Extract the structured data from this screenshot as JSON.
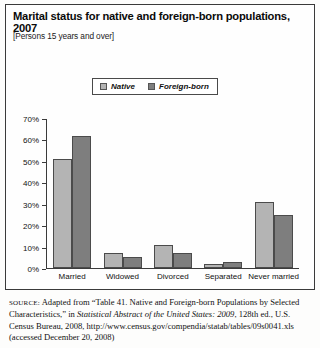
{
  "figure": {
    "title": "Marital status for native and foreign-born populations, 2007",
    "subtitle": "[Persons 15 years and over]"
  },
  "legend": {
    "items": [
      {
        "label": "Native",
        "color": "#b4b4b4",
        "icon": "legend-swatch-icon"
      },
      {
        "label": "Foreign-born",
        "color": "#7e7e7e",
        "icon": "legend-swatch-icon"
      }
    ]
  },
  "source": {
    "label": "SOURCE:",
    "text": " Adapted from “Table 41. Native and Foreign-born Populations by Selected Characteristics,” in ",
    "italic_title": "Statistical Abstract of the United States: 2009",
    "text_after": ", 128th ed., U.S. Census Bureau, 2008, http://www.census.gov/compendia/statab/tables/09s0041.xls (accessed December 20, 2008)"
  },
  "chart_data": {
    "type": "bar",
    "title": "Marital status for native and foreign-born populations, 2007",
    "subtitle": "[Persons 15 years and over]",
    "xlabel": "",
    "ylabel": "",
    "ylim": [
      0,
      70
    ],
    "ytick_labels": [
      "70%",
      "60%",
      "50%",
      "40%",
      "30%",
      "20%",
      "10%",
      "0%"
    ],
    "ytick_values": [
      70,
      60,
      50,
      40,
      30,
      20,
      10,
      0
    ],
    "grid": false,
    "legend_position": "top-center",
    "categories": [
      "Married",
      "Widowed",
      "Divorced",
      "Separated",
      "Never married"
    ],
    "series": [
      {
        "name": "Native",
        "color": "#b4b4b4",
        "values": [
          51,
          7,
          11,
          2,
          31
        ]
      },
      {
        "name": "Foreign-born",
        "color": "#7e7e7e",
        "values": [
          62,
          5,
          7,
          3,
          25
        ]
      }
    ]
  }
}
